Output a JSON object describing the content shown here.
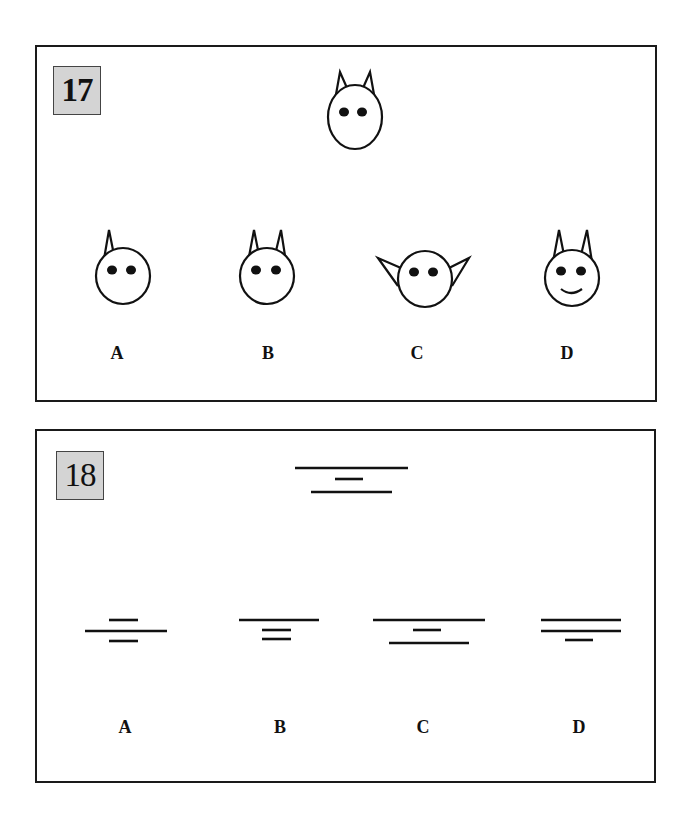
{
  "puzzles": [
    {
      "number": "17",
      "description": "Head figure with two upright ears and two eyes; choose matching option",
      "options": [
        {
          "label": "A",
          "variant": "one upright ear, two eyes"
        },
        {
          "label": "B",
          "variant": "two upright ears, two eyes"
        },
        {
          "label": "C",
          "variant": "two sideways ears, two eyes"
        },
        {
          "label": "D",
          "variant": "two upright ears, two eyes, smile"
        }
      ]
    },
    {
      "number": "18",
      "description": "Three stacked horizontal lines: long, short, medium; choose matching option",
      "options": [
        {
          "label": "A",
          "variant": "short, long, short"
        },
        {
          "label": "B",
          "variant": "long, short, short"
        },
        {
          "label": "C",
          "variant": "long, short, medium"
        },
        {
          "label": "D",
          "variant": "long, long, short"
        }
      ]
    }
  ],
  "colors": {
    "stroke": "#111111",
    "badge_bg": "#d4d4d4",
    "border": "#1a1a1a"
  }
}
